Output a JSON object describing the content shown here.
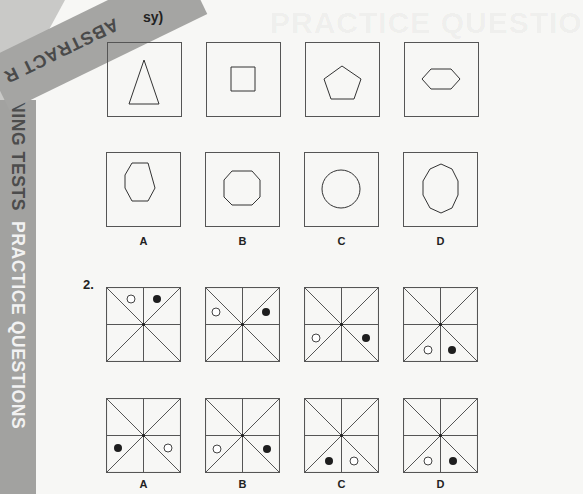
{
  "page": {
    "section_tab": "ABSTRACT R",
    "side_strip": {
      "part1": "NING TESTS",
      "part2": "PRACTICE QUESTIONS"
    },
    "heading_fragment": "sy)",
    "bleed_through": "PRACTICE QUESTIO"
  },
  "questions": [
    {
      "number": "1.",
      "number_visible": false,
      "sequence": [
        {
          "shape": "triangle",
          "points": "22,62 37,18 52,62"
        },
        {
          "shape": "square",
          "points": "25,25 49,25 49,49 25,49"
        },
        {
          "shape": "pentagon",
          "points": "37,24 56,37 49,57 26,57 19,37"
        },
        {
          "shape": "hexagon",
          "points": "27,27 47,27 56,37 47,47 27,47 18,37"
        }
      ],
      "options": [
        {
          "label": "A",
          "shape": "irregular-heptagon",
          "points": "26,11 42,11 49,36 42,49 26,49 19,36 19,23"
        },
        {
          "label": "B",
          "shape": "octagon",
          "points": "27,19 47,19 55,28 55,45 47,53 27,53 19,45 19,28"
        },
        {
          "label": "C",
          "shape": "circle",
          "circle": {
            "cx": 37,
            "cy": 37,
            "r": 19
          }
        },
        {
          "label": "D",
          "shape": "decagon",
          "points": "38,12 49,17 55,29 55,43 49,56 38,61 27,56 20,43 20,29 27,17"
        }
      ]
    },
    {
      "number": "2.",
      "number_visible": true,
      "sequence": [
        {
          "white": [
            25,
            12
          ],
          "black": [
            51,
            12
          ]
        },
        {
          "white": [
            11,
            25
          ],
          "black": [
            61,
            25
          ]
        },
        {
          "white": [
            12,
            51
          ],
          "black": [
            62,
            51
          ]
        },
        {
          "white": [
            25,
            63
          ],
          "black": [
            49,
            63
          ]
        }
      ],
      "options": [
        {
          "label": "A",
          "white": [
            62,
            50
          ],
          "black": [
            12,
            50
          ]
        },
        {
          "label": "B",
          "white": [
            12,
            51
          ],
          "black": [
            62,
            51
          ]
        },
        {
          "label": "C",
          "white": [
            50,
            63
          ],
          "black": [
            25,
            63
          ]
        },
        {
          "label": "D",
          "white": [
            25,
            63
          ],
          "black": [
            50,
            63
          ]
        }
      ]
    }
  ],
  "colors": {
    "page": "#f7f7f5",
    "strip": "#a2a2a0",
    "strip_dark_text": "#4c4c4c",
    "strip_light_text": "#f2f2f2",
    "line": "#555555",
    "dot_fill": "#1e1e1e"
  }
}
